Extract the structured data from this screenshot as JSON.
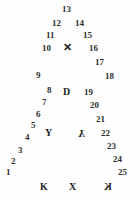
{
  "figure": {
    "width": 140,
    "height": 200,
    "background": "#ffffff",
    "ink_color": "#2b2b2b"
  },
  "left_arm": [
    {
      "label": "1",
      "x": 6,
      "y": 168
    },
    {
      "label": "2",
      "x": 11,
      "y": 157
    },
    {
      "label": "3",
      "x": 18,
      "y": 146
    },
    {
      "label": "4",
      "x": 25,
      "y": 133
    },
    {
      "label": "5",
      "x": 31,
      "y": 121
    },
    {
      "label": "6",
      "x": 36,
      "y": 110
    },
    {
      "label": "7",
      "x": 42,
      "y": 98
    },
    {
      "label": "8",
      "x": 47,
      "y": 86
    },
    {
      "label": "9",
      "x": 36,
      "y": 71
    },
    {
      "label": "10",
      "x": 42,
      "y": 44
    },
    {
      "label": "11",
      "x": 46,
      "y": 31
    },
    {
      "label": "12",
      "x": 52,
      "y": 19
    }
  ],
  "apex": {
    "label": "13",
    "x": 62,
    "y": 5
  },
  "right_arm": [
    {
      "label": "14",
      "x": 75,
      "y": 19
    },
    {
      "label": "15",
      "x": 83,
      "y": 31
    },
    {
      "label": "16",
      "x": 89,
      "y": 44
    },
    {
      "label": "17",
      "x": 95,
      "y": 58
    },
    {
      "label": "18",
      "x": 105,
      "y": 72
    },
    {
      "label": "19",
      "x": 84,
      "y": 88
    },
    {
      "label": "20",
      "x": 90,
      "y": 101
    },
    {
      "label": "21",
      "x": 96,
      "y": 115
    },
    {
      "label": "22",
      "x": 101,
      "y": 129
    },
    {
      "label": "23",
      "x": 107,
      "y": 142
    },
    {
      "label": "24",
      "x": 113,
      "y": 155
    },
    {
      "label": "25",
      "x": 118,
      "y": 168
    }
  ],
  "interior_glyphs": [
    {
      "name": "times-glyph",
      "label": "✕",
      "x": 63,
      "y": 42,
      "variant": "times"
    },
    {
      "name": "letter-d-glyph",
      "label": "D",
      "x": 63,
      "y": 87,
      "variant": "plain"
    },
    {
      "name": "letter-y-glyph",
      "label": "Y",
      "x": 45,
      "y": 128,
      "variant": "plain"
    },
    {
      "name": "letter-y-mirrored-glyph",
      "label": "Y",
      "x": 78,
      "y": 128,
      "variant": "flip-v"
    }
  ],
  "bottom_glyphs": [
    {
      "name": "letter-k-glyph",
      "label": "K",
      "x": 40,
      "y": 182,
      "variant": "plain"
    },
    {
      "name": "letter-x-glyph",
      "label": "X",
      "x": 69,
      "y": 182,
      "variant": "plain"
    },
    {
      "name": "letter-k-mirrored-glyph",
      "label": "K",
      "x": 104,
      "y": 182,
      "variant": "flip-h"
    }
  ]
}
